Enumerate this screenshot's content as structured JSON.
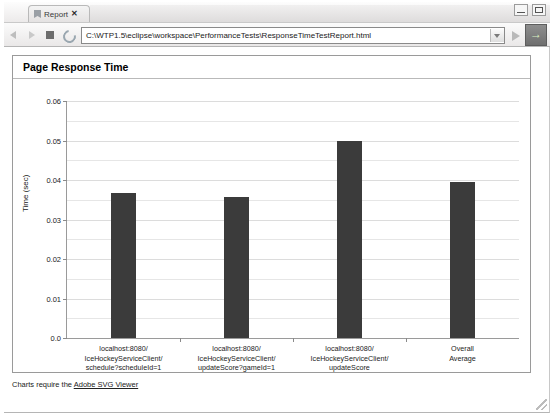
{
  "window": {
    "tab_label": "Report",
    "tab_icon": "page-icon",
    "close_label": "✕",
    "minimize_label": "",
    "maximize_label": ""
  },
  "toolbar": {
    "back_icon": "back-arrow-icon",
    "forward_icon": "forward-arrow-icon",
    "stop_icon": "stop-icon",
    "refresh_icon": "refresh-icon",
    "url": "C:\\WTP1.5\\eclipse\\workspace\\PerformanceTests\\ResponseTimeTestReport.html",
    "url_placeholder": "Address",
    "dropdown_icon": "chevron-down-icon",
    "go_icon": "go-arrow-icon",
    "launch_icon": "green-arrow-icon"
  },
  "report": {
    "title": "Page Response Time",
    "footer_prefix": "Charts require the ",
    "footer_link": "Adobe SVG Viewer"
  },
  "chart_data": {
    "type": "bar",
    "title": "Page Response Time",
    "xlabel": "",
    "ylabel": "Time (sec)",
    "ylim": [
      0.0,
      0.06
    ],
    "ytick_values": [
      0.0,
      0.01,
      0.02,
      0.03,
      0.04,
      0.05,
      0.06
    ],
    "ytick_labels": [
      "0.0",
      "0.01",
      "0.02",
      "0.03",
      "0.04",
      "0.05",
      "0.06"
    ],
    "minor_gridlines": true,
    "grid": true,
    "legend": null,
    "bar_color": "#3b3b3b",
    "categories": [
      "localhost:8080/\nIceHockeyServiceClient/\nschedule?scheduleId=1",
      "localhost:8080/\nIceHockeyServiceClient/\nupdateScore?gameId=1",
      "localhost:8080/\nIceHockeyServiceClient/\nupdateScore",
      "Overall\nAverage"
    ],
    "category_lines": [
      [
        "localhost:8080/",
        "IceHockeyServiceClient/",
        "schedule?scheduleId=1"
      ],
      [
        "localhost:8080/",
        "IceHockeyServiceClient/",
        "updateScore?gameId=1"
      ],
      [
        "localhost:8080/",
        "IceHockeyServiceClient/",
        "updateScore"
      ],
      [
        "Overall",
        "Average"
      ]
    ],
    "values": [
      0.0366,
      0.0356,
      0.05,
      0.0394
    ]
  }
}
